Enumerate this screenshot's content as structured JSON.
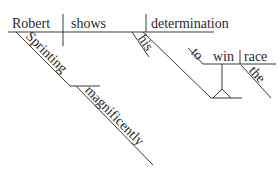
{
  "diagram": {
    "type": "sentence-diagram",
    "style": "Reed-Kellogg",
    "line_color": "#3a3a3a",
    "text_color": "#2a2a2a",
    "words": {
      "subject": "Robert",
      "verb": "shows",
      "object": "determination",
      "object_modifier": "his",
      "subject_modifier_participle": "Sprinting",
      "participle_modifier": "magnificently",
      "infinitive_marker": "to",
      "infinitive_verb": "win",
      "infinitive_object": "race",
      "infinitive_object_modifier": "the"
    }
  }
}
